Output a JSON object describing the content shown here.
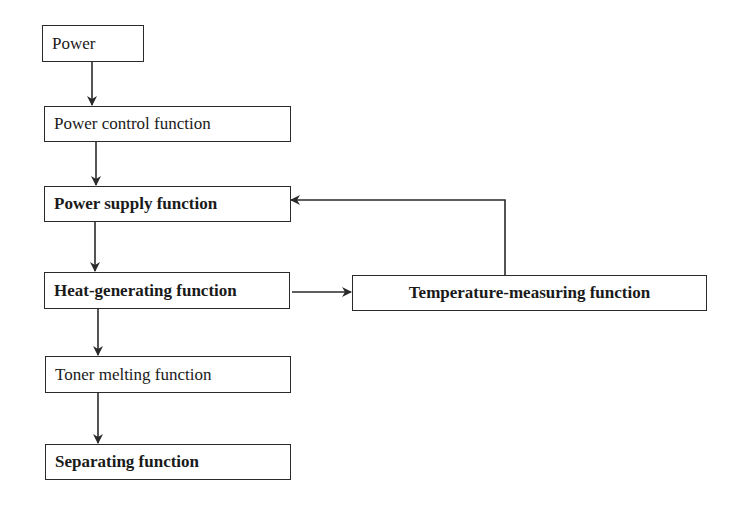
{
  "diagram": {
    "type": "flowchart",
    "nodes": [
      {
        "id": "power",
        "label": "Power",
        "bold": false
      },
      {
        "id": "power_control",
        "label": "Power control function",
        "bold": false
      },
      {
        "id": "power_supply",
        "label": "Power supply function",
        "bold": true
      },
      {
        "id": "heat_generating",
        "label": "Heat-generating function",
        "bold": true
      },
      {
        "id": "temperature_measuring",
        "label": "Temperature-measuring function",
        "bold": true
      },
      {
        "id": "toner_melting",
        "label": "Toner melting function",
        "bold": false
      },
      {
        "id": "separating",
        "label": "Separating function",
        "bold": true
      }
    ],
    "edges": [
      {
        "from": "power",
        "to": "power_control"
      },
      {
        "from": "power_control",
        "to": "power_supply"
      },
      {
        "from": "power_supply",
        "to": "heat_generating"
      },
      {
        "from": "heat_generating",
        "to": "temperature_measuring"
      },
      {
        "from": "temperature_measuring",
        "to": "power_supply",
        "kind": "feedback"
      },
      {
        "from": "heat_generating",
        "to": "toner_melting"
      },
      {
        "from": "toner_melting",
        "to": "separating"
      }
    ],
    "colors": {
      "line": "#2a2a2a",
      "background": "#ffffff"
    }
  }
}
